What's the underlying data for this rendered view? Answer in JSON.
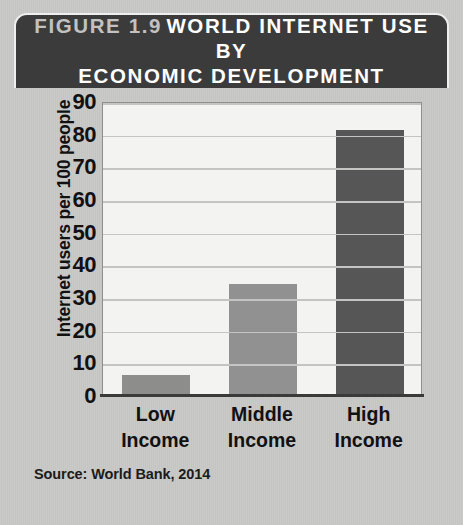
{
  "figure": {
    "number_label": "FIGURE 1.9",
    "title": "WORLD INTERNET USE BY ECONOMIC DEVELOPMENT",
    "title_line_1": "WORLD INTERNET USE BY",
    "title_line_2": "ECONOMIC DEVELOPMENT",
    "source": "Source: World Bank, 2014",
    "header_bg": "#3b3b3b",
    "card_bg": "#c8c8c6"
  },
  "chart_data": {
    "type": "bar",
    "title": "WORLD INTERNET USE BY ECONOMIC DEVELOPMENT",
    "categories": [
      "Low Income",
      "Middle Income",
      "High Income"
    ],
    "category_lines": [
      [
        "Low",
        "Income"
      ],
      [
        "Middle",
        "Income"
      ],
      [
        "High",
        "Income"
      ]
    ],
    "values": [
      6,
      34,
      81
    ],
    "xlabel": "",
    "ylabel": "Internet users per 100 people",
    "ylim": [
      0,
      90
    ],
    "yticks": [
      0,
      10,
      20,
      30,
      40,
      50,
      60,
      70,
      80,
      90
    ],
    "ytick_labels": [
      "0",
      "10",
      "20",
      "30",
      "40",
      "50",
      "60",
      "70",
      "80",
      "90"
    ],
    "grid": true,
    "legend": "none",
    "bar_colors": [
      "#8d8d8b",
      "#919191",
      "#565656"
    ],
    "plot_bg": "#f3f3f1",
    "gridline_color": "#c4c4c2",
    "axis_color": "#3a3a3a",
    "source_note": "Source: World Bank, 2014"
  }
}
